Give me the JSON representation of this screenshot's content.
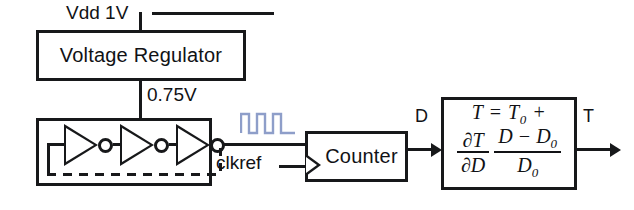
{
  "diagram": {
    "supply_label": "Vdd 1V",
    "regulated_label": "0.75V",
    "clock_label": "clkref",
    "count_label": "D",
    "temp_label": "T",
    "blocks": {
      "regulator": "Voltage Regulator",
      "counter": "Counter",
      "ring_oscillator": "",
      "equation": ""
    },
    "equation": {
      "line1_lhs": "T",
      "line1_eq": "=",
      "line1_rhs": "T",
      "line1_rhs_sub": "0",
      "line1_plus": "+",
      "slope_num": "∂T",
      "slope_den": "∂D",
      "ratio_num_d": "D",
      "ratio_num_minus": "−",
      "ratio_num_d0": "D",
      "ratio_num_d0_sub": "0",
      "ratio_den": "D",
      "ratio_den_sub": "0",
      "plain_text": "T = T0 + (∂T/∂D)((D − D0)/D0)"
    },
    "inverters": [
      {
        "name": "inverter-1"
      },
      {
        "name": "inverter-2"
      },
      {
        "name": "inverter-3"
      }
    ],
    "colors": {
      "line": "#17181a",
      "text": "#111215",
      "clock_wave": "#8e9ec9",
      "background": "#ffffff"
    }
  }
}
